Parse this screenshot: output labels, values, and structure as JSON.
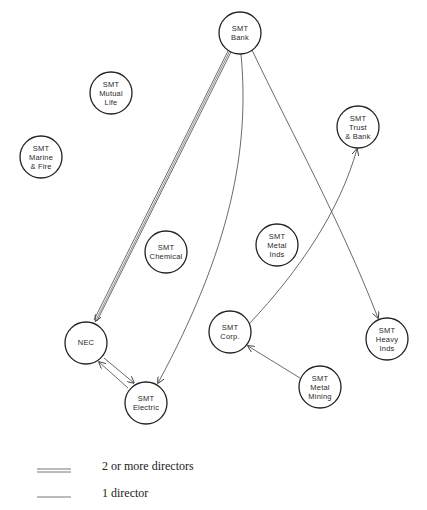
{
  "diagram": {
    "nodes": [
      {
        "id": "bank",
        "lines": [
          "SMT",
          "Bank"
        ],
        "cx": 240,
        "cy": 33
      },
      {
        "id": "mutual-life",
        "lines": [
          "SMT",
          "Mutual",
          "Life"
        ],
        "cx": 111,
        "cy": 93
      },
      {
        "id": "marine-fire",
        "lines": [
          "SMT",
          "Marine",
          "& Fire"
        ],
        "cx": 41,
        "cy": 157
      },
      {
        "id": "trust-bank",
        "lines": [
          "SMT",
          "Trust",
          "& Bank"
        ],
        "cx": 358,
        "cy": 127
      },
      {
        "id": "chemical",
        "lines": [
          "SMT",
          "Chemical"
        ],
        "cx": 166,
        "cy": 252
      },
      {
        "id": "metal-inds",
        "lines": [
          "SMT",
          "Metal",
          "Inds"
        ],
        "cx": 277,
        "cy": 245
      },
      {
        "id": "nec",
        "lines": [
          "NEC"
        ],
        "cx": 86,
        "cy": 343
      },
      {
        "id": "corp",
        "lines": [
          "SMT",
          "Corp."
        ],
        "cx": 230,
        "cy": 332
      },
      {
        "id": "heavy-inds",
        "lines": [
          "SMT",
          "Heavy",
          "Inds"
        ],
        "cx": 387,
        "cy": 339
      },
      {
        "id": "electric",
        "lines": [
          "SMT",
          "Electric"
        ],
        "cx": 146,
        "cy": 403
      },
      {
        "id": "metal-mining",
        "lines": [
          "SMT",
          "Metal",
          "Mining"
        ],
        "cx": 320,
        "cy": 387
      }
    ],
    "edges": [
      {
        "from": "SMT Bank",
        "to": "NEC",
        "directors": "2 or more"
      },
      {
        "from": "SMT Bank",
        "to": "SMT Electric",
        "directors": "1"
      },
      {
        "from": "SMT Bank",
        "to": "SMT Heavy Inds",
        "directors": "1"
      },
      {
        "from": "SMT Corp.",
        "to": "SMT Trust & Bank",
        "directors": "1"
      },
      {
        "from": "SMT Metal Mining",
        "to": "SMT Corp.",
        "directors": "1"
      },
      {
        "from": "NEC",
        "to": "SMT Electric",
        "directors": "1"
      },
      {
        "from": "SMT Electric",
        "to": "NEC",
        "directors": "1"
      }
    ]
  },
  "labels": {
    "bank": {
      "l1": "SMT",
      "l2": "Bank"
    },
    "mutual_life": {
      "l1": "SMT",
      "l2": "Mutual",
      "l3": "Life"
    },
    "marine_fire": {
      "l1": "SMT",
      "l2": "Marine",
      "l3": "& Fire"
    },
    "trust_bank": {
      "l1": "SMT",
      "l2": "Trust",
      "l3": "& Bank"
    },
    "chemical": {
      "l1": "SMT",
      "l2": "Chemical"
    },
    "metal_inds": {
      "l1": "SMT",
      "l2": "Metal",
      "l3": "Inds"
    },
    "nec": {
      "l1": "NEC"
    },
    "corp": {
      "l1": "SMT",
      "l2": "Corp."
    },
    "heavy_inds": {
      "l1": "SMT",
      "l2": "Heavy",
      "l3": "Inds"
    },
    "electric": {
      "l1": "SMT",
      "l2": "Electric"
    },
    "metal_mining": {
      "l1": "SMT",
      "l2": "Metal",
      "l3": "Mining"
    }
  },
  "legend": {
    "double_line_label": "2 or more directors",
    "single_line_label": "1 director"
  },
  "colors": {
    "stroke": "#333333",
    "background": "#ffffff"
  }
}
